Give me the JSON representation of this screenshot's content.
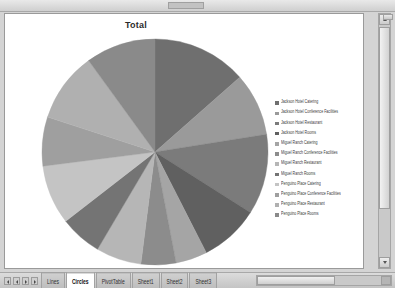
{
  "window": {
    "scroll": {
      "vertical_present": true,
      "horizontal_present": true
    }
  },
  "chart": {
    "title": "Total"
  },
  "legend": {
    "entries": [
      {
        "label": "Jackson Hotel Catering",
        "color": "#6f6f6f"
      },
      {
        "label": "Jackson Hotel Conference  Facilities",
        "color": "#9a9a9a"
      },
      {
        "label": "Jackson Hotel Restaurant",
        "color": "#7b7b7b"
      },
      {
        "label": "Jackson Hotel Rooms",
        "color": "#606060"
      },
      {
        "label": "Miguel Ranch Catering",
        "color": "#a5a5a5"
      },
      {
        "label": "Miguel Ranch Conference  Facilities",
        "color": "#8c8c8c"
      },
      {
        "label": "Miguel Ranch Restaurant",
        "color": "#b6b6b6"
      },
      {
        "label": "Miguel Ranch Rooms",
        "color": "#747474"
      },
      {
        "label": "Penguino Place Catering",
        "color": "#c4c4c4"
      },
      {
        "label": "Penguino Place Conference  Facilities",
        "color": "#9f9f9f"
      },
      {
        "label": "Penguino Place Restaurant",
        "color": "#b0b0b0"
      },
      {
        "label": "Penguino Place Rooms",
        "color": "#8a8a8a"
      }
    ]
  },
  "chart_data": {
    "type": "pie",
    "title": "Total",
    "legend_position": "right",
    "categories": [
      "Jackson Hotel Catering",
      "Jackson Hotel Conference  Facilities",
      "Jackson Hotel Restaurant",
      "Jackson Hotel Rooms",
      "Miguel Ranch Catering",
      "Miguel Ranch Conference  Facilities",
      "Miguel Ranch Restaurant",
      "Miguel Ranch Rooms",
      "Penguino Place Catering",
      "Penguino Place Conference  Facilities",
      "Penguino Place Restaurant",
      "Penguino Place Rooms"
    ],
    "values": [
      13.5,
      9.0,
      11.5,
      8.5,
      4.5,
      5.0,
      6.5,
      6.0,
      8.5,
      7.0,
      10.0,
      10.0
    ],
    "colors": [
      "#6f6f6f",
      "#9a9a9a",
      "#7b7b7b",
      "#606060",
      "#a5a5a5",
      "#8c8c8c",
      "#b6b6b6",
      "#747474",
      "#c4c4c4",
      "#9f9f9f",
      "#b0b0b0",
      "#8a8a8a"
    ],
    "start_angle_deg": -90,
    "direction": "clockwise",
    "units": "percent"
  },
  "sheet_tabs": {
    "items": [
      {
        "label": "Lines",
        "active": false
      },
      {
        "label": "Circles",
        "active": true
      },
      {
        "label": "PivotTable",
        "active": false
      },
      {
        "label": "Sheet1",
        "active": false
      },
      {
        "label": "Sheet2",
        "active": false
      },
      {
        "label": "Sheet3",
        "active": false
      }
    ],
    "nav_buttons": [
      "first-sheet",
      "previous-sheet",
      "next-sheet",
      "last-sheet"
    ]
  }
}
